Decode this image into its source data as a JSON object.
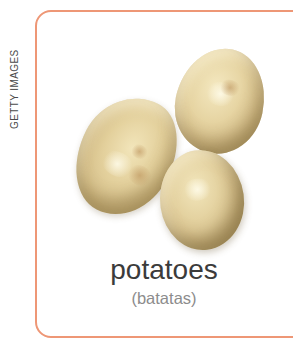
{
  "credit": {
    "label": "GETTY IMAGES"
  },
  "card": {
    "word": "potatoes",
    "translation": "(batatas)",
    "border_color": "#ee9776"
  },
  "photo": {
    "name": "three-potatoes-photo",
    "potato_base_color": "#ddc795",
    "potato_highlight_color": "#f4e8c0",
    "potato_shadow_color": "#9c8756"
  },
  "text_colors": {
    "word": "#3b3b3b",
    "translation": "#8c8c8c",
    "credit": "#4a4a4a"
  }
}
